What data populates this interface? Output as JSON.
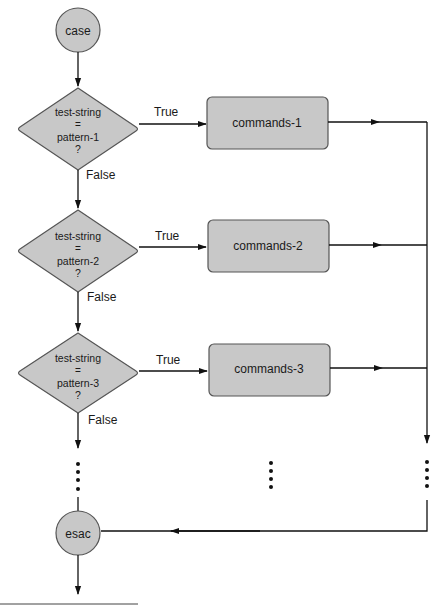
{
  "colors": {
    "shape_fill": "#c8c8c8",
    "shape_stroke": "#555555",
    "line": "#111111",
    "text": "#1a1a1a",
    "background": "#ffffff"
  },
  "start_node": {
    "label": "case"
  },
  "end_node": {
    "label": "esac"
  },
  "decisions": [
    {
      "line1": "test-string",
      "line2": "=",
      "line3": "pattern-1",
      "line4": "?",
      "true_label": "True",
      "false_label": "False"
    },
    {
      "line1": "test-string",
      "line2": "=",
      "line3": "pattern-2",
      "line4": "?",
      "true_label": "True",
      "false_label": "False"
    },
    {
      "line1": "test-string",
      "line2": "=",
      "line3": "pattern-3",
      "line4": "?",
      "true_label": "True",
      "false_label": "False"
    }
  ],
  "commands": [
    {
      "label": "commands-1"
    },
    {
      "label": "commands-2"
    },
    {
      "label": "commands-3"
    }
  ],
  "ellipsis": {
    "dot_count": 4
  }
}
